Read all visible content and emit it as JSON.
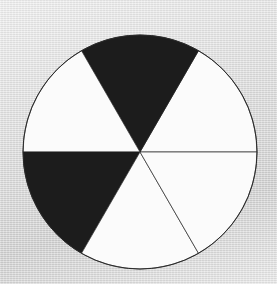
{
  "image": {
    "width": 277,
    "height": 284,
    "background_color": "#dcdcdc",
    "title": "Six-sector black and white calibration wheel"
  },
  "wheel": {
    "center_x": 140,
    "center_y": 152,
    "radius": 117,
    "outline_color": "#2a2a2a",
    "outline_width": 1,
    "sector_count": 6,
    "sector_angle_deg": 60,
    "black_color": "#1c1c1c",
    "white_color": "#fbfbfb",
    "sectors": [
      {
        "name": "sector-right-upper",
        "start_deg": 0,
        "end_deg": 60,
        "fill": "white"
      },
      {
        "name": "sector-top",
        "start_deg": 60,
        "end_deg": 120,
        "fill": "black"
      },
      {
        "name": "sector-left-upper",
        "start_deg": 120,
        "end_deg": 180,
        "fill": "white"
      },
      {
        "name": "sector-left-lower",
        "start_deg": 180,
        "end_deg": 240,
        "fill": "black"
      },
      {
        "name": "sector-bottom",
        "start_deg": 240,
        "end_deg": 300,
        "fill": "white"
      },
      {
        "name": "sector-right-lower",
        "start_deg": 300,
        "end_deg": 360,
        "fill": "white"
      }
    ]
  },
  "chart_data": {
    "type": "pie",
    "categories": [
      "0-60",
      "60-120",
      "120-180",
      "180-240",
      "240-300",
      "300-360"
    ],
    "values": [
      60,
      60,
      60,
      60,
      60,
      60
    ],
    "colors": [
      "#fbfbfb",
      "#1c1c1c",
      "#fbfbfb",
      "#1c1c1c",
      "#fbfbfb",
      "#fbfbfb"
    ],
    "xlabel": "",
    "ylabel": "",
    "legend": "none",
    "grid": false
  }
}
